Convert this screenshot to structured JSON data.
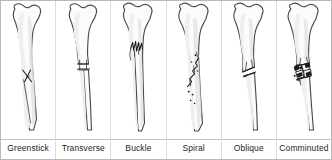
{
  "figure": {
    "panel_count": 6,
    "colors": {
      "background": "#ffffff",
      "frame_border": "#b9b9b9",
      "panel_divider": "#dcdcdc",
      "label_rule": "#c2c2c2",
      "bone_fill": "#fbfbfb",
      "bone_outline": "#4a4a4a",
      "bone_shading": "#e4e4e4",
      "fracture_line": "#1a1a1a",
      "label_text": "#1d1d1d"
    }
  },
  "panels": [
    {
      "label": "Greenstick",
      "icon": "bone-greenstick-icon",
      "description": "Incomplete fracture; bone bends and cracks only partway through the shaft"
    },
    {
      "label": "Transverse",
      "icon": "bone-transverse-icon",
      "description": "Complete break running straight across the shaft at a right angle"
    },
    {
      "label": "Buckle",
      "icon": "bone-buckle-icon",
      "description": "Compression fracture; cortex crumples into a jagged torus near the metaphysis"
    },
    {
      "label": "Spiral",
      "icon": "bone-spiral-icon",
      "description": "Twisting fracture line winding diagonally around the shaft"
    },
    {
      "label": "Oblique",
      "icon": "bone-oblique-icon",
      "description": "Angled break across the shaft with lateral displacement"
    },
    {
      "label": "Comminuted",
      "icon": "bone-comminuted-icon",
      "description": "Bone shattered into multiple separate fragments at the break site"
    }
  ]
}
